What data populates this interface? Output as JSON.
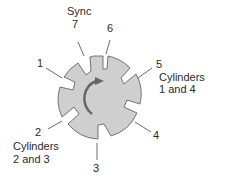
{
  "diagram": {
    "type": "crankshaft reluctor/trigger wheel",
    "wheel_fill": "#cfcfcf",
    "wheel_stroke": "#555555",
    "arrow_color": "#666666",
    "rotation": "clockwise",
    "labels": {
      "sync": "Sync",
      "n7": "7",
      "n6": "6",
      "n1": "1",
      "n5": "5",
      "cyl14_line1": "Cylinders",
      "cyl14_line2": "1 and 4",
      "n2": "2",
      "cyl23_line1": "Cylinders",
      "cyl23_line2": "2 and 3",
      "n3": "3",
      "n4": "4"
    }
  }
}
